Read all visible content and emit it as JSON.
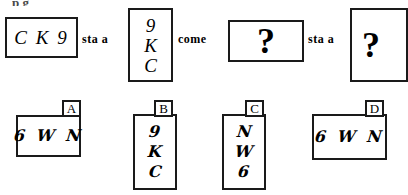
{
  "figure": {
    "type": "verbal-analogy-puzzle",
    "cut_off_text_above": "p          g",
    "stem": {
      "term1": {
        "box_label": "term-1",
        "orientation": "horizontal",
        "content": "C K 9"
      },
      "connector1": "sta a",
      "term2": {
        "box_label": "term-2",
        "orientation": "vertical",
        "lines": [
          "9",
          "K",
          "C"
        ]
      },
      "connector2": "come",
      "term3": {
        "box_label": "term-3",
        "orientation": "horizontal",
        "content": "?"
      },
      "connector3": "sta a",
      "term4": {
        "box_label": "term-4",
        "orientation": "vertical",
        "content": "?"
      }
    },
    "options": [
      {
        "letter": "A",
        "orientation": "horizontal",
        "content": "6 W N",
        "lines": [
          "6 W N"
        ]
      },
      {
        "letter": "B",
        "orientation": "vertical",
        "content": "9 K C",
        "lines": [
          "9",
          "K",
          "C"
        ]
      },
      {
        "letter": "C",
        "orientation": "vertical",
        "content": "N W 6",
        "lines": [
          "N",
          "W",
          "6"
        ]
      },
      {
        "letter": "D",
        "orientation": "horizontal",
        "content": "6 W N",
        "lines": [
          "6 W N"
        ]
      }
    ]
  },
  "colors": {
    "ink": "#1a1a1a",
    "paper": "#ffffff",
    "faded_ink": "#4a4a4a"
  }
}
